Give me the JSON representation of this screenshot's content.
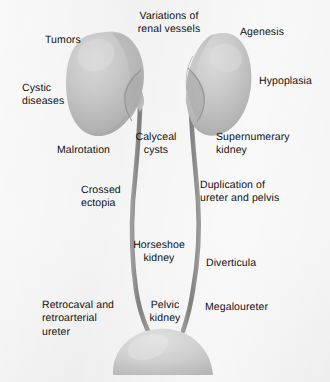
{
  "figure": {
    "background_color": "#f3f3f3",
    "organ_fill_color": "#c4c4c4",
    "organ_shade_color": "#9a9a9a",
    "ureter_color": "#8b8b8b",
    "label_color": "#111111"
  },
  "organs": [
    {
      "name": "left-kidney",
      "label": "kidney",
      "side": "left",
      "description": "larger kidney, hilum medial"
    },
    {
      "name": "right-kidney",
      "label": "kidney",
      "side": "right",
      "description": "smaller hypoplastic kidney, hilum medial"
    },
    {
      "name": "left-ureter",
      "label": "ureter",
      "side": "left"
    },
    {
      "name": "right-ureter",
      "label": "ureter",
      "side": "right"
    },
    {
      "name": "bladder",
      "label": "bladder",
      "side": "center"
    }
  ],
  "labels": [
    {
      "id": "tumors",
      "text": "Tumors",
      "align": "left",
      "x": 45,
      "y": 34
    },
    {
      "id": "variations",
      "text": "Variations of\nrenal vessels",
      "align": "center",
      "x": 169,
      "y": 10
    },
    {
      "id": "agenesis",
      "text": "Agenesis",
      "align": "left",
      "x": 240,
      "y": 26
    },
    {
      "id": "cystic-diseases",
      "text": "Cystic\ndiseases",
      "align": "left",
      "x": 22,
      "y": 82
    },
    {
      "id": "hypoplasia",
      "text": "Hypoplasia",
      "align": "left",
      "x": 259,
      "y": 75
    },
    {
      "id": "malrotation",
      "text": "Malrotation",
      "align": "left",
      "x": 57,
      "y": 144
    },
    {
      "id": "calyceal-cysts",
      "text": "Calyceal\ncysts",
      "align": "center",
      "x": 156,
      "y": 131
    },
    {
      "id": "supernumerary",
      "text": "Supernumerary\nkidney",
      "align": "left",
      "x": 216,
      "y": 131
    },
    {
      "id": "crossed-ectopia",
      "text": "Crossed\nectopia",
      "align": "left",
      "x": 81,
      "y": 184
    },
    {
      "id": "duplication",
      "text": "Duplication of\nureter and pelvis",
      "align": "left",
      "x": 200,
      "y": 179
    },
    {
      "id": "horseshoe",
      "text": "Horseshoe\nkidney",
      "align": "center",
      "x": 159,
      "y": 239
    },
    {
      "id": "diverticula",
      "text": "Diverticula",
      "align": "left",
      "x": 206,
      "y": 257
    },
    {
      "id": "retrocaval",
      "text": "Retrocaval and\nretroarterial\nureter",
      "align": "left",
      "x": 42,
      "y": 299
    },
    {
      "id": "pelvic-kidney",
      "text": "Pelvic\nkidney",
      "align": "center",
      "x": 165,
      "y": 299
    },
    {
      "id": "megaloureter",
      "text": "Megaloureter",
      "align": "left",
      "x": 205,
      "y": 301
    }
  ]
}
